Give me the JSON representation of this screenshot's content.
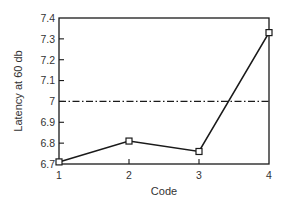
{
  "chart_data": {
    "type": "line",
    "title": "",
    "xlabel": "Code",
    "ylabel": "Latency at 60 db",
    "x": [
      1,
      2,
      3,
      4
    ],
    "categories": [
      "1",
      "2",
      "3",
      "4"
    ],
    "series": [
      {
        "name": "Latency",
        "values": [
          6.71,
          6.81,
          6.76,
          7.33
        ],
        "marker": "open-square",
        "color": "#1a1a1a"
      }
    ],
    "reference_lines": [
      {
        "y": 7.0,
        "style": "dash-dot",
        "color": "#1a1a1a"
      }
    ],
    "xlim": [
      1,
      4
    ],
    "ylim": [
      6.7,
      7.4
    ],
    "xticks": [
      "1",
      "2",
      "3",
      "4"
    ],
    "yticks": [
      "6.7",
      "6.8",
      "6.9",
      "7",
      "7.1",
      "7.2",
      "7.3",
      "7.4"
    ],
    "grid": false,
    "legend": null
  }
}
